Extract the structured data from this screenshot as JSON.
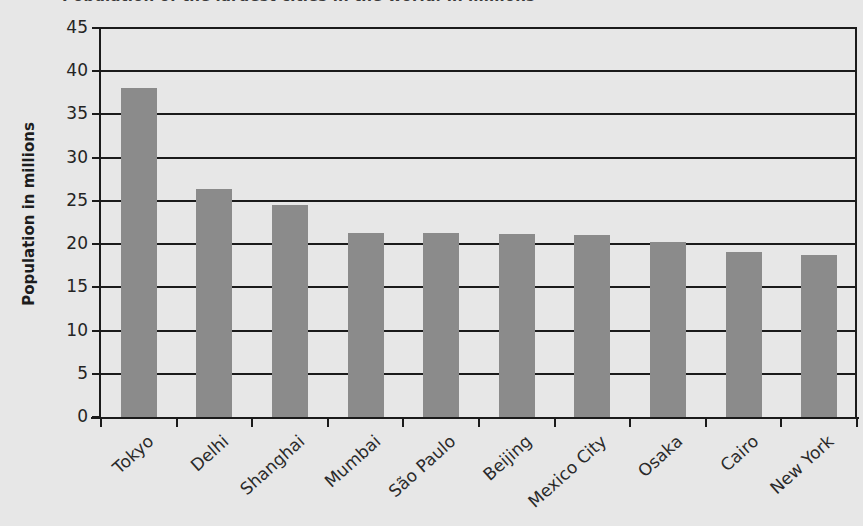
{
  "chart_data": {
    "type": "bar",
    "title": "Population of the largest cities in the world, in millions",
    "xlabel": "",
    "ylabel": "Population in millions",
    "categories": [
      "Tokyo",
      "Delhi",
      "Shanghai",
      "Mumbai",
      "São Paulo",
      "Beijing",
      "Mexico City",
      "Osaka",
      "Cairo",
      "New York"
    ],
    "values": [
      38.1,
      26.4,
      24.5,
      21.3,
      21.3,
      21.2,
      21.1,
      20.2,
      19.1,
      18.7
    ],
    "ylim": [
      0,
      45
    ],
    "ytick_step": 5,
    "yticks": [
      "45",
      "40",
      "35",
      "30",
      "25",
      "20",
      "15",
      "10",
      "5",
      "0"
    ],
    "grid": true,
    "legend": false,
    "bar_color": "#8b8b8b",
    "axis_color": "#1b1b1b",
    "background_color": "#e7e7e7",
    "text_color": "#242424"
  }
}
